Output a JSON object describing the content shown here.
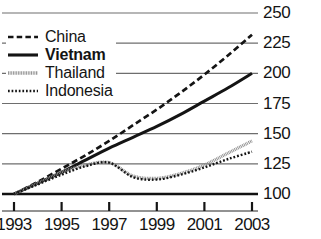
{
  "chart_data": {
    "type": "line",
    "title": "",
    "xlabel": "",
    "ylabel": "GDP",
    "grid": true,
    "legend_position": "top-left",
    "x": [
      1993,
      1994,
      1995,
      1996,
      1997,
      1998,
      1999,
      2000,
      2001,
      2002,
      2003
    ],
    "xticks": [
      "1993",
      "1995",
      "1997",
      "1999",
      "2001",
      "2003"
    ],
    "xtick_values": [
      1993,
      1995,
      1997,
      1999,
      2001,
      2003
    ],
    "xlim": [
      1993,
      2003
    ],
    "yticks": [
      "100",
      "125",
      "150",
      "175",
      "200",
      "225",
      "250"
    ],
    "ytick_values": [
      100,
      125,
      150,
      175,
      200,
      225,
      250
    ],
    "ylim": [
      95,
      250
    ],
    "series": [
      {
        "name": "China",
        "style": "dashed",
        "values": [
          100,
          110,
          121,
          132,
          144,
          157,
          170,
          184,
          199,
          215,
          232
        ]
      },
      {
        "name": "Vietnam",
        "style": "solid-bold",
        "values": [
          100,
          109,
          118,
          128,
          138,
          147,
          156,
          166,
          177,
          188,
          200
        ]
      },
      {
        "name": "Thailand",
        "style": "fine-dotted",
        "values": [
          100,
          109,
          118,
          124,
          126,
          115,
          113,
          117,
          124,
          134,
          144
        ]
      },
      {
        "name": "Indonesia",
        "style": "dotted",
        "values": [
          100,
          108,
          116,
          123,
          126,
          114,
          112,
          116,
          122,
          129,
          135
        ]
      }
    ]
  },
  "legend": {
    "items": [
      {
        "label": "China"
      },
      {
        "label": "Vietnam"
      },
      {
        "label": "Thailand"
      },
      {
        "label": "Indonesia"
      }
    ]
  },
  "axis": {
    "y_title": "GDP"
  },
  "colors": {
    "ink": "#141414",
    "grid": "#6e6e6e",
    "baseline": "#111111",
    "thailand": "#8c8c8c"
  }
}
